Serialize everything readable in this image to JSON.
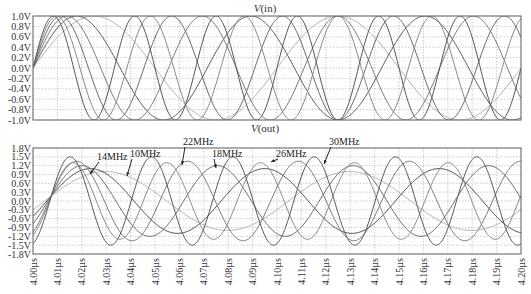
{
  "chart_data": [
    {
      "type": "line",
      "title": "V(in)",
      "title_italic_part": "V",
      "title_rest": "(in)",
      "xlabel": "",
      "ylabel": "",
      "ylim": [
        -1.0,
        1.0
      ],
      "xlim": [
        4.0,
        4.2
      ],
      "x_unit": "µs",
      "grid": true,
      "yticks": [
        "1.0V",
        "0.8V",
        "0.6V",
        "0.4V",
        "0.2V",
        "0.0V",
        "-0.2V",
        "-0.4V",
        "-0.6V",
        "-0.8V",
        "-1.0V"
      ],
      "ytick_values": [
        1.0,
        0.8,
        0.6,
        0.4,
        0.2,
        0.0,
        -0.2,
        -0.4,
        -0.6,
        -0.8,
        -1.0
      ],
      "series": [
        {
          "name": "10MHz",
          "freq_mhz": 10,
          "amplitude": 1.0,
          "phase": 0,
          "color": "#b0b0b0"
        },
        {
          "name": "14MHz",
          "freq_mhz": 14,
          "amplitude": 1.0,
          "phase": 0,
          "color": "#555555"
        },
        {
          "name": "18MHz",
          "freq_mhz": 18,
          "amplitude": 1.0,
          "phase": 0,
          "color": "#777777"
        },
        {
          "name": "22MHz",
          "freq_mhz": 22,
          "amplitude": 1.0,
          "phase": 0,
          "color": "#666666"
        },
        {
          "name": "26MHz",
          "freq_mhz": 26,
          "amplitude": 1.0,
          "phase": 0,
          "color": "#888888"
        },
        {
          "name": "30MHz",
          "freq_mhz": 30,
          "amplitude": 1.0,
          "phase": 0,
          "color": "#555555"
        }
      ]
    },
    {
      "type": "line",
      "title": "V(out)",
      "title_italic_part": "V",
      "title_rest": "(out)",
      "xlabel": "",
      "ylabel": "",
      "ylim": [
        -1.8,
        1.8
      ],
      "xlim": [
        4.0,
        4.2
      ],
      "x_unit": "µs",
      "grid": true,
      "yticks": [
        "1.8V",
        "1.5V",
        "1.2V",
        "0.9V",
        "0.6V",
        "0.3V",
        "0.0V",
        "-0.3V",
        "-0.6V",
        "-0.9V",
        "-1.2V",
        "-1.5V",
        "-1.8V"
      ],
      "ytick_values": [
        1.8,
        1.5,
        1.2,
        0.9,
        0.6,
        0.3,
        0.0,
        -0.3,
        -0.6,
        -0.9,
        -1.2,
        -1.5,
        -1.8
      ],
      "xticks": [
        "4.00µs",
        "4.01µs",
        "4.02µs",
        "4.03µs",
        "4.04µs",
        "4.05µs",
        "4.06µs",
        "4.07µs",
        "4.08µs",
        "4.09µs",
        "4.10µs",
        "4.11µs",
        "4.12µs",
        "4.13µs",
        "4.14µs",
        "4.15µs",
        "4.16µs",
        "4.17µs",
        "4.18µs",
        "4.19µs",
        "4.20µs"
      ],
      "series": [
        {
          "name": "10MHz",
          "freq_mhz": 10,
          "amplitude": 1.0,
          "phase": -0.3,
          "color": "#b0b0b0"
        },
        {
          "name": "14MHz",
          "freq_mhz": 14,
          "amplitude": 1.1,
          "phase": -0.5,
          "color": "#444444"
        },
        {
          "name": "18MHz",
          "freq_mhz": 18,
          "amplitude": 1.2,
          "phase": -0.7,
          "color": "#666666"
        },
        {
          "name": "22MHz",
          "freq_mhz": 22,
          "amplitude": 1.35,
          "phase": -0.9,
          "color": "#777777"
        },
        {
          "name": "26MHz",
          "freq_mhz": 26,
          "amplitude": 1.3,
          "phase": -1.1,
          "color": "#888888"
        },
        {
          "name": "30MHz",
          "freq_mhz": 30,
          "amplitude": 1.5,
          "phase": -1.3,
          "color": "#555555"
        }
      ],
      "annotations": [
        {
          "text": "14MHz",
          "x": 97,
          "y": 160,
          "arrow_to": [
            90,
            174
          ]
        },
        {
          "text": "10MHz",
          "x": 130,
          "y": 157,
          "arrow_to": [
            127,
            176
          ]
        },
        {
          "text": "22MHz",
          "x": 183,
          "y": 145,
          "arrow_to": [
            182,
            165
          ]
        },
        {
          "text": "18MHz",
          "x": 212,
          "y": 157,
          "arrow_to": [
            216,
            168
          ]
        },
        {
          "text": "26MHz",
          "x": 276,
          "y": 157,
          "arrow_to": [
            271,
            162
          ]
        },
        {
          "text": "30MHz",
          "x": 329,
          "y": 145,
          "arrow_to": [
            324,
            164
          ]
        }
      ]
    }
  ]
}
